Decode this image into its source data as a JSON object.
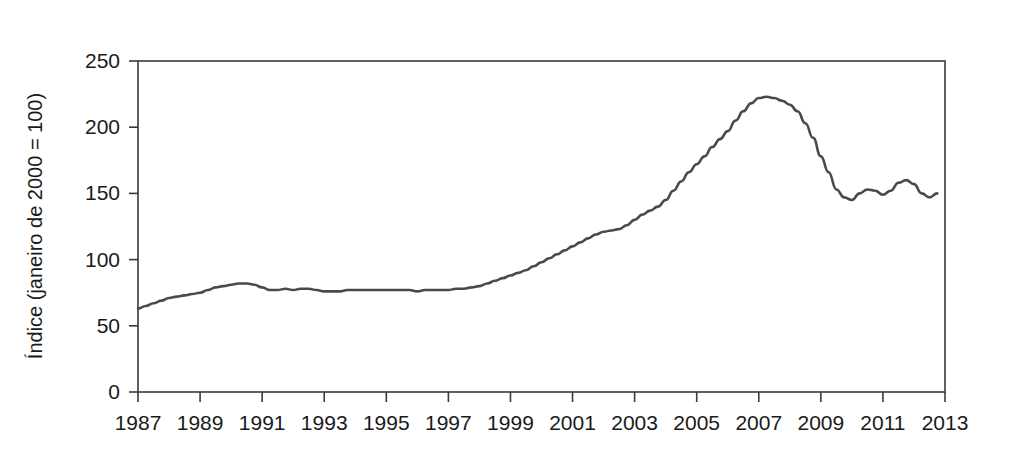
{
  "figure": {
    "background_color": "#ffffff",
    "line_color": "#4a4a4a",
    "axis_color": "#3a3a3a",
    "top_bar_color": "#171717"
  },
  "chart_data": {
    "type": "line",
    "title": "",
    "subtitle": "",
    "xlabel": "",
    "ylabel": "Índice (janeiro de 2000 = 100)",
    "xlim": [
      1987,
      2013
    ],
    "ylim": [
      0,
      250
    ],
    "grid": false,
    "legend": null,
    "xticks": [
      1987,
      1989,
      1991,
      1993,
      1995,
      1997,
      1999,
      2001,
      2003,
      2005,
      2007,
      2009,
      2011,
      2013
    ],
    "xticklabels": [
      "1987",
      "1989",
      "1991",
      "1993",
      "1995",
      "1997",
      "1999",
      "2001",
      "2003",
      "2005",
      "2007",
      "2009",
      "2011",
      "2013"
    ],
    "yticks": [
      0,
      50,
      100,
      150,
      200,
      250
    ],
    "yticklabels": [
      "0",
      "50",
      "100",
      "150",
      "200",
      "250"
    ],
    "series": [
      {
        "name": "Índice de preços das casas",
        "color": "#4a4a4a",
        "x": [
          1987.0,
          1987.25,
          1987.5,
          1987.75,
          1988.0,
          1988.25,
          1988.5,
          1988.75,
          1989.0,
          1989.25,
          1989.5,
          1989.75,
          1990.0,
          1990.25,
          1990.5,
          1990.75,
          1991.0,
          1991.25,
          1991.5,
          1991.75,
          1992.0,
          1992.25,
          1992.5,
          1992.75,
          1993.0,
          1993.25,
          1993.5,
          1993.75,
          1994.0,
          1994.25,
          1994.5,
          1994.75,
          1995.0,
          1995.25,
          1995.5,
          1995.75,
          1996.0,
          1996.25,
          1996.5,
          1996.75,
          1997.0,
          1997.25,
          1997.5,
          1997.75,
          1998.0,
          1998.25,
          1998.5,
          1998.75,
          1999.0,
          1999.25,
          1999.5,
          1999.75,
          2000.0,
          2000.25,
          2000.5,
          2000.75,
          2001.0,
          2001.25,
          2001.5,
          2001.75,
          2002.0,
          2002.25,
          2002.5,
          2002.75,
          2003.0,
          2003.25,
          2003.5,
          2003.75,
          2004.0,
          2004.25,
          2004.5,
          2004.75,
          2005.0,
          2005.25,
          2005.5,
          2005.75,
          2006.0,
          2006.25,
          2006.5,
          2006.75,
          2007.0,
          2007.25,
          2007.5,
          2007.75,
          2008.0,
          2008.25,
          2008.5,
          2008.75,
          2009.0,
          2009.25,
          2009.5,
          2009.75,
          2010.0,
          2010.25,
          2010.5,
          2010.75,
          2011.0,
          2011.25,
          2011.5,
          2011.75,
          2012.0,
          2012.25,
          2012.5,
          2012.75
        ],
        "y": [
          63,
          65,
          67,
          69,
          71,
          72,
          73,
          74,
          75,
          77,
          79,
          80,
          81,
          82,
          82,
          81,
          79,
          77,
          77,
          78,
          77,
          78,
          78,
          77,
          76,
          76,
          76,
          77,
          77,
          77,
          77,
          77,
          77,
          77,
          77,
          77,
          76,
          77,
          77,
          77,
          77,
          78,
          78,
          79,
          80,
          82,
          84,
          86,
          88,
          90,
          92,
          95,
          98,
          101,
          104,
          107,
          110,
          113,
          116,
          119,
          121,
          122,
          123,
          126,
          130,
          134,
          137,
          140,
          145,
          152,
          159,
          166,
          172,
          178,
          185,
          191,
          197,
          205,
          212,
          218,
          222,
          223,
          222,
          220,
          217,
          212,
          203,
          192,
          178,
          166,
          153,
          147,
          145,
          150,
          153,
          152,
          149,
          152,
          158,
          160,
          157,
          150,
          147,
          150
        ]
      }
    ],
    "annotations": {
      "peak_value": 223,
      "peak_year": 2007,
      "start_value": 63,
      "start_year": 1987,
      "end_value": 145,
      "end_year": 2012.75
    }
  }
}
